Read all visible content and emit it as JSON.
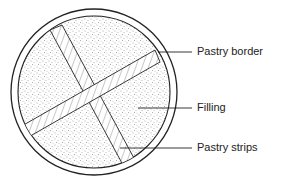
{
  "diagram": {
    "labels": [
      {
        "id": "pastry-border",
        "text": "Pastry border"
      },
      {
        "id": "filling",
        "text": "Filling"
      },
      {
        "id": "pastry-strips",
        "text": "Pastry strips"
      }
    ]
  }
}
